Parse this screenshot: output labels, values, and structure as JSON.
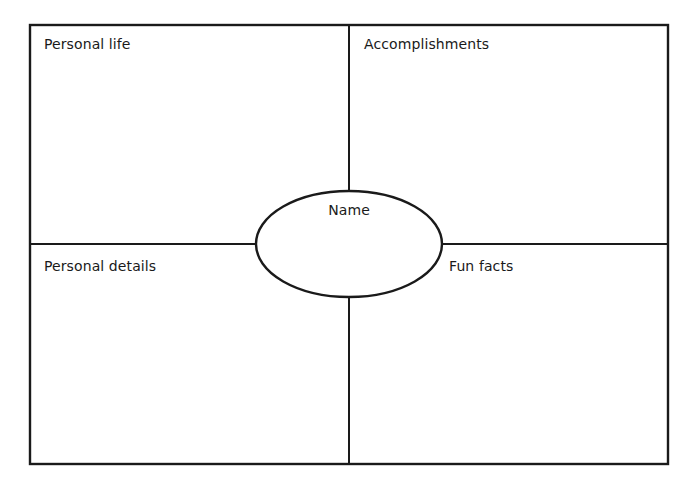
{
  "diagram": {
    "type": "four-square organizer",
    "center": {
      "label": "Name"
    },
    "quadrants": [
      {
        "position": "top-left",
        "label": "Personal life"
      },
      {
        "position": "top-right",
        "label": "Accomplishments"
      },
      {
        "position": "bottom-left",
        "label": "Personal details"
      },
      {
        "position": "bottom-right",
        "label": "Fun facts"
      }
    ],
    "line_color": "#1a1a1a",
    "background": "#ffffff"
  }
}
